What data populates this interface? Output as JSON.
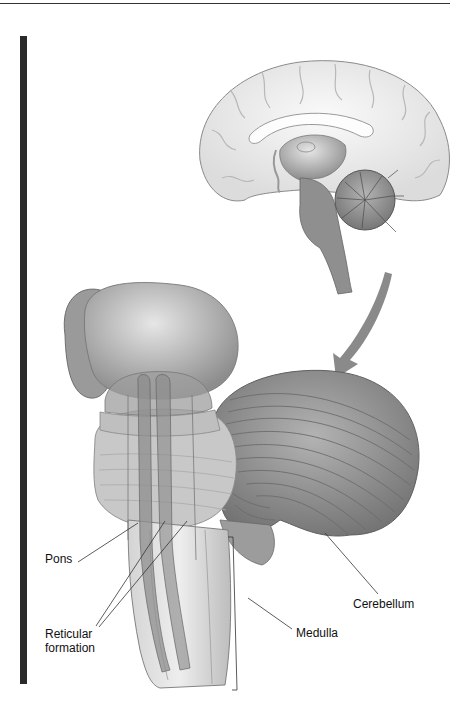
{
  "figure": {
    "labels": {
      "pons": "Pons",
      "reticular_line1": "Reticular",
      "reticular_line2": "formation",
      "medulla": "Medulla",
      "cerebellum": "Cerebellum"
    },
    "colors": {
      "sidebar": "#2a2a2a",
      "cortex": "#f1f1f1",
      "cortex_outline": "#8a8a8a",
      "brainstem": "#8f8f8f",
      "cerebellum": "#8c8c8c",
      "thalamus": "#b9b9b9",
      "arrow": "#8a8a8a",
      "leader_line": "#333333"
    }
  }
}
